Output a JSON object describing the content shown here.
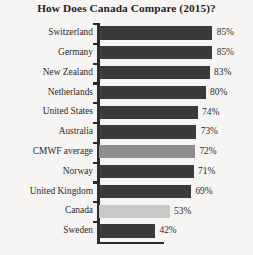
{
  "chart_data": {
    "type": "bar",
    "orientation": "horizontal",
    "title": "How Does Canada Compare (2015)?",
    "xlabel": "",
    "ylabel": "",
    "xlim": [
      0,
      100
    ],
    "grid": false,
    "legend": false,
    "value_suffix": "%",
    "categories": [
      "Switzerland",
      "Germany",
      "New Zealand",
      "Netherlands",
      "United States",
      "Australia",
      "CMWF average",
      "Norway",
      "United Kingdom",
      "Canada",
      "Sweden"
    ],
    "values": [
      85,
      85,
      83,
      80,
      74,
      73,
      72,
      71,
      69,
      53,
      42
    ],
    "value_labels": [
      "85%",
      "85%",
      "83%",
      "80%",
      "74%",
      "73%",
      "72%",
      "71%",
      "69%",
      "53%",
      "42%"
    ],
    "bar_styles": [
      "dark",
      "dark",
      "dark",
      "dark",
      "dark",
      "dark",
      "mid",
      "dark",
      "dark",
      "light",
      "dark"
    ],
    "colors": {
      "dark": "#3a3a3a",
      "mid": "#8e8e8e",
      "light": "#c9c9c9",
      "axis": "#2b2b2b",
      "text": "#2b2b2b",
      "background": "#f6f5f3"
    }
  }
}
